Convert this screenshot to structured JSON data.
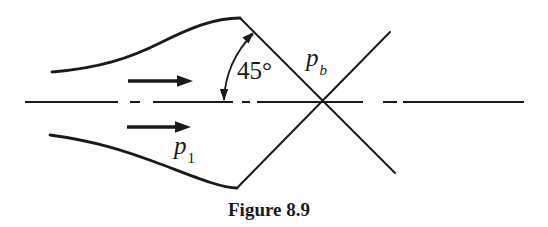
{
  "colors": {
    "ink": "#1a1a1a",
    "background": "#ffffff"
  },
  "labels": {
    "angle": "45°",
    "back_pressure": {
      "base": "p",
      "sub": "b"
    },
    "inlet_pressure": {
      "base": "p",
      "sub": "1"
    }
  },
  "caption": "Figure 8.9"
}
